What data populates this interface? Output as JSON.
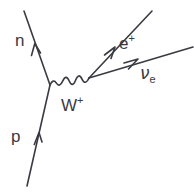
{
  "diagram": {
    "type": "feynman-diagram",
    "background_color": "#ffffff",
    "stroke_color": "#3a3a42",
    "label_color": "#3a3a42",
    "stroke_width": 1.6,
    "labels": {
      "neutron": "n",
      "proton": "p",
      "w_boson": "W",
      "w_boson_charge": "+",
      "positron": "e",
      "positron_charge": "+",
      "neutrino": "ν",
      "neutrino_subscript": "e"
    },
    "vertices": [
      {
        "name": "left-vertex",
        "x": 50,
        "y": 85
      },
      {
        "name": "right-vertex",
        "x": 89,
        "y": 78
      }
    ],
    "lines": [
      {
        "name": "proton-line",
        "particle": "p",
        "kind": "fermion",
        "from": {
          "x": 27,
          "y": 186
        },
        "to": {
          "x": 50,
          "y": 85
        },
        "arrow_at": {
          "x": 38,
          "y": 137
        },
        "arrow_direction": "up-right"
      },
      {
        "name": "neutron-line",
        "particle": "n",
        "kind": "fermion",
        "from": {
          "x": 50,
          "y": 85
        },
        "to": {
          "x": 24,
          "y": 11
        },
        "arrow_at": {
          "x": 36,
          "y": 47
        },
        "arrow_direction": "up-left"
      },
      {
        "name": "w-boson-propagator",
        "particle": "W+",
        "kind": "boson-wavy",
        "from": {
          "x": 50,
          "y": 85
        },
        "to": {
          "x": 89,
          "y": 78
        },
        "oscillations": 5,
        "amplitude": 5
      },
      {
        "name": "positron-line",
        "particle": "e+",
        "kind": "fermion",
        "from": {
          "x": 89,
          "y": 78
        },
        "to": {
          "x": 152,
          "y": 11
        },
        "arrow_at": {
          "x": 112,
          "y": 53
        },
        "arrow_direction": "up-right"
      },
      {
        "name": "neutrino-line",
        "particle": "nu_e",
        "kind": "fermion",
        "from": {
          "x": 89,
          "y": 78
        },
        "to": {
          "x": 193,
          "y": 47
        },
        "arrow_at": {
          "x": 134,
          "y": 64
        },
        "arrow_direction": "right-up"
      }
    ]
  }
}
